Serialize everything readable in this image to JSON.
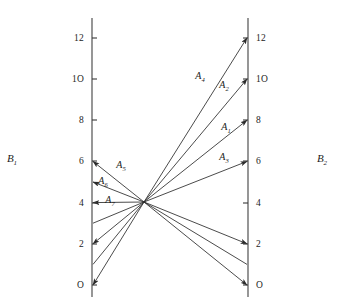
{
  "figure": {
    "type": "nomogram",
    "background": "#ffffff",
    "ink_color": "#1c1c1c",
    "line_color": "#2b2b2b",
    "axis_color": "#4a4a4a"
  },
  "axes": {
    "left": {
      "name": "B",
      "subscript": "1",
      "label_text": "B₁",
      "x": 92,
      "y_top": 18,
      "y_bottom": 297,
      "value_min": 0,
      "value_max": 12,
      "y_at_zero": 285,
      "px_per_unit": 20.6,
      "tick_side": "left",
      "ticks": [
        {
          "value": 12,
          "label": "12",
          "y": 38
        },
        {
          "value": 10,
          "label": "1O",
          "y": 79
        },
        {
          "value": 8,
          "label": "8",
          "y": 120
        },
        {
          "value": 6,
          "label": "6",
          "y": 161
        },
        {
          "value": 4,
          "label": "4",
          "y": 203
        },
        {
          "value": 2,
          "label": "2",
          "y": 244
        },
        {
          "value": 0,
          "label": "O",
          "y": 285
        }
      ]
    },
    "right": {
      "name": "B",
      "subscript": "2",
      "label_text": "B₂",
      "x": 248,
      "y_top": 18,
      "y_bottom": 297,
      "value_min": 0,
      "value_max": 12,
      "y_at_zero": 285,
      "px_per_unit": 20.6,
      "tick_side": "right",
      "ticks": [
        {
          "value": 12,
          "label": "12",
          "y": 38
        },
        {
          "value": 10,
          "label": "1O",
          "y": 79
        },
        {
          "value": 8,
          "label": "8",
          "y": 120
        },
        {
          "value": 6,
          "label": "6",
          "y": 161
        },
        {
          "value": 4,
          "label": "4",
          "y": 203
        },
        {
          "value": 2,
          "label": "2",
          "y": 244
        },
        {
          "value": 0,
          "label": "O",
          "y": 285
        }
      ]
    }
  },
  "convergence_point": {
    "x": 144,
    "y": 202,
    "value": 4
  },
  "rays": [
    {
      "id": "A1",
      "name": "A",
      "subscript": "1",
      "label_text": "A₁",
      "left_value": 1,
      "right_value": 8,
      "left_arrow": false,
      "right_arrow": true,
      "label_x": 226,
      "label_y": 130
    },
    {
      "id": "A2",
      "name": "A",
      "subscript": "2",
      "label_text": "A₂",
      "left_value": 0,
      "right_value": 10,
      "left_arrow": true,
      "right_arrow": true,
      "label_x": 224,
      "label_y": 88
    },
    {
      "id": "A3",
      "name": "A",
      "subscript": "3",
      "label_text": "A₃",
      "left_value": 3,
      "right_value": 6,
      "left_arrow": false,
      "right_arrow": true,
      "label_x": 224,
      "label_y": 160
    },
    {
      "id": "A4",
      "name": "A",
      "subscript": "4",
      "label_text": "A₄",
      "left_value": 2,
      "right_value": 12,
      "left_arrow": true,
      "right_arrow": true,
      "label_x": 200,
      "label_y": 79
    },
    {
      "id": "A5",
      "name": "A",
      "subscript": "5",
      "label_text": "A₅",
      "left_value": 6,
      "right_value": 2,
      "left_arrow": true,
      "right_arrow": true,
      "label_x": 121,
      "label_y": 168
    },
    {
      "id": "A6",
      "name": "A",
      "subscript": "6",
      "label_text": "A₆",
      "left_value": 5,
      "right_value": 1,
      "left_arrow": true,
      "right_arrow": false,
      "label_x": 103,
      "label_y": 184
    },
    {
      "id": "A7",
      "name": "A",
      "subscript": "7",
      "label_text": "A₇",
      "left_value": 4,
      "right_value": 0,
      "left_arrow": true,
      "right_arrow": true,
      "label_x": 110,
      "label_y": 203
    }
  ],
  "chart_data": {
    "type": "line",
    "title": "",
    "xlabel": "",
    "ylabel": "",
    "ylim": [
      0,
      12
    ],
    "grid": false,
    "legend": "none",
    "categories": [
      "B₁",
      "B₂"
    ],
    "series": [
      {
        "name": "A₁",
        "values": [
          1,
          8
        ]
      },
      {
        "name": "A₂",
        "values": [
          0,
          10
        ]
      },
      {
        "name": "A₃",
        "values": [
          3,
          6
        ]
      },
      {
        "name": "A₄",
        "values": [
          2,
          12
        ]
      },
      {
        "name": "A₅",
        "values": [
          6,
          2
        ]
      },
      {
        "name": "A₆",
        "values": [
          5,
          1
        ]
      },
      {
        "name": "A₇",
        "values": [
          4,
          0
        ]
      }
    ],
    "tick_labels": [
      "O",
      "2",
      "4",
      "6",
      "8",
      "1O",
      "12"
    ]
  }
}
